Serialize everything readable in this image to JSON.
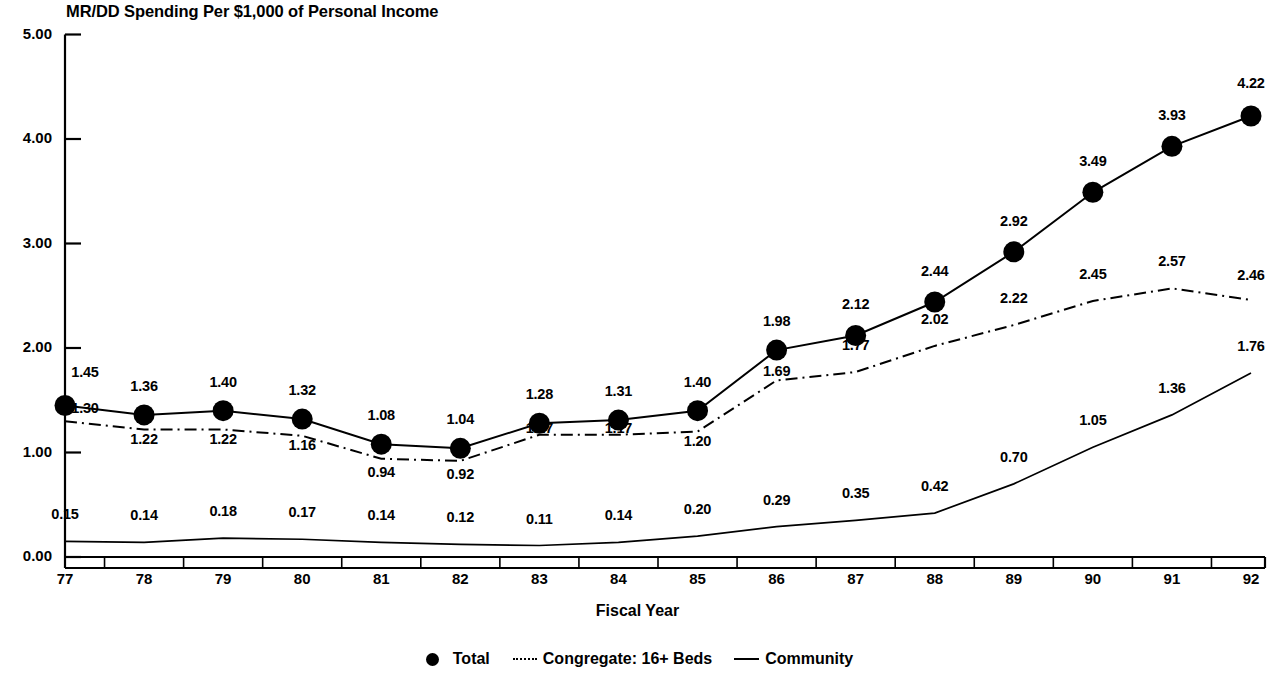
{
  "chart_data": {
    "type": "line",
    "title": "MR/DD Spending Per $1,000 of Personal Income",
    "xlabel": "Fiscal Year",
    "ylabel": "",
    "categories": [
      "77",
      "78",
      "79",
      "80",
      "81",
      "82",
      "83",
      "84",
      "85",
      "86",
      "87",
      "88",
      "89",
      "90",
      "91",
      "92"
    ],
    "ylim": [
      0,
      5
    ],
    "ytick_labels": [
      "0.00",
      "1.00",
      "2.00",
      "3.00",
      "4.00",
      "5.00"
    ],
    "ytick_values": [
      0,
      1,
      2,
      3,
      4,
      5
    ],
    "grid": false,
    "legend_position": "bottom",
    "series": [
      {
        "name": "Total",
        "style": "solid-with-markers",
        "values": [
          1.45,
          1.36,
          1.4,
          1.32,
          1.08,
          1.04,
          1.28,
          1.31,
          1.4,
          1.98,
          2.12,
          2.44,
          2.92,
          3.49,
          3.93,
          4.22
        ],
        "labels": [
          "1.45",
          "1.36",
          "1.40",
          "1.32",
          "1.08",
          "1.04",
          "1.28",
          "1.31",
          "1.40",
          "1.98",
          "2.12",
          "2.44",
          "2.92",
          "3.49",
          "3.93",
          "4.22"
        ]
      },
      {
        "name": "Congregate: 16+ Beds",
        "style": "dash-dot",
        "values": [
          1.3,
          1.22,
          1.22,
          1.16,
          0.94,
          0.92,
          1.17,
          1.17,
          1.2,
          1.69,
          1.77,
          2.02,
          2.22,
          2.45,
          2.57,
          2.46
        ],
        "labels": [
          "1.30",
          "1.22",
          "1.22",
          "1.16",
          "0.94",
          "0.92",
          "1.17",
          "1.17",
          "1.20",
          "1.69",
          "1.77",
          "2.02",
          "2.22",
          "2.45",
          "2.57",
          "2.46"
        ]
      },
      {
        "name": "Community",
        "style": "solid",
        "values": [
          0.15,
          0.14,
          0.18,
          0.17,
          0.14,
          0.12,
          0.11,
          0.14,
          0.2,
          0.29,
          0.35,
          0.42,
          0.7,
          1.05,
          1.36,
          1.76
        ],
        "labels": [
          "0.15",
          "0.14",
          "0.18",
          "0.17",
          "0.14",
          "0.12",
          "0.11",
          "0.14",
          "0.20",
          "0.29",
          "0.35",
          "0.42",
          "0.70",
          "1.05",
          "1.36",
          "1.76"
        ]
      }
    ],
    "colors": {
      "axis": "#000000",
      "total": "#000000",
      "congregate": "#000000",
      "community": "#000000",
      "background": "#ffffff"
    }
  }
}
